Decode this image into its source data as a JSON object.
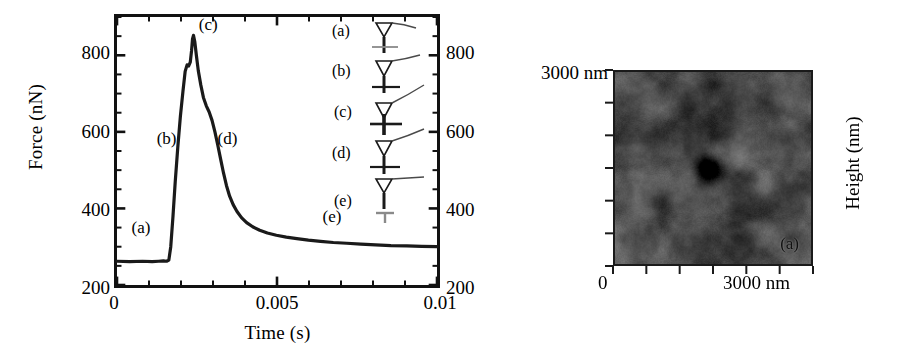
{
  "figure": {
    "panels": [
      "force-time-curve",
      "afm-topography"
    ]
  },
  "chart_data": [
    {
      "id": "force-vs-time",
      "type": "line",
      "title": "",
      "xlabel": "Time (s)",
      "ylabel": "Force (nN)",
      "xlim": [
        0,
        0.01
      ],
      "ylim": [
        200,
        900
      ],
      "xticks": [
        0,
        0.005,
        0.01
      ],
      "xticklabels": [
        "0",
        "0.005",
        "0.01"
      ],
      "yticks": [
        200,
        400,
        600,
        800
      ],
      "yticklabels": [
        "200",
        "400",
        "600",
        "800"
      ],
      "y_minor_tick_step": 50,
      "x_minor_tick_step": 0.001,
      "right_axis_mirrored": true,
      "right_yticklabels": [
        "200",
        "400",
        "600",
        "800"
      ],
      "grid": false,
      "legend": "none",
      "line_color": "#1a1a1a",
      "x": [
        0.0,
        0.0004,
        0.0008,
        0.0011,
        0.0013,
        0.00145,
        0.00155,
        0.00162,
        0.00168,
        0.00175,
        0.00182,
        0.0019,
        0.00198,
        0.00206,
        0.00213,
        0.00219,
        0.00224,
        0.00229,
        0.00233,
        0.00236,
        0.00239,
        0.00243,
        0.00248,
        0.00254,
        0.00262,
        0.0027,
        0.00279,
        0.00288,
        0.00297,
        0.00306,
        0.00315,
        0.00324,
        0.00333,
        0.00342,
        0.00352,
        0.00363,
        0.00375,
        0.00389,
        0.00405,
        0.00424,
        0.00446,
        0.0047,
        0.00498,
        0.00529,
        0.00562,
        0.00598,
        0.00636,
        0.00676,
        0.00718,
        0.00762,
        0.00808,
        0.00856,
        0.00906,
        0.00952,
        0.01
      ],
      "y": [
        262,
        261,
        262,
        261,
        262,
        263,
        262,
        265,
        300,
        380,
        470,
        560,
        640,
        705,
        758,
        775,
        772,
        782,
        812,
        843,
        852,
        836,
        800,
        760,
        722,
        690,
        668,
        652,
        630,
        600,
        565,
        528,
        492,
        460,
        432,
        410,
        392,
        376,
        363,
        352,
        343,
        336,
        330,
        325,
        321,
        317,
        314,
        311,
        309,
        307,
        305,
        303,
        302,
        301,
        300
      ],
      "annotations": [
        {
          "label": "(a)",
          "x": 0.00075,
          "y": 348
        },
        {
          "label": "(b)",
          "x": 0.00155,
          "y": 582
        },
        {
          "label": "(c)",
          "x": 0.00285,
          "y": 878
        },
        {
          "label": "(d)",
          "x": 0.00345,
          "y": 582
        },
        {
          "label": "(e)",
          "x": 0.00672,
          "y": 378
        }
      ],
      "inset": {
        "description": "AFM cantilever-tip schematic sequence",
        "rows": [
          {
            "label": "(a)"
          },
          {
            "label": "(b)"
          },
          {
            "label": "(c)"
          },
          {
            "label": "(d)"
          },
          {
            "label": "(e)"
          }
        ]
      }
    },
    {
      "id": "afm-topography",
      "type": "heatmap",
      "title": "",
      "xlabel": "",
      "ylabel": "Height (nm)",
      "x_axis_min_label": "0",
      "x_axis_max_label": "3000 nm",
      "y_axis_min_label": "0",
      "y_axis_max_label": "3000 nm",
      "xlim": [
        0,
        3000
      ],
      "ylim": [
        0,
        3000
      ],
      "x_tick_count": 7,
      "y_tick_count": 7,
      "colormap": "grayscale",
      "panel_label": "(a)",
      "feature": "dark indentation pit near image centre"
    }
  ],
  "left_panel": {
    "y_axis_title": "Force (nN)",
    "x_axis_title": "Time (s)",
    "y_tick_labels": [
      "800",
      "600",
      "400",
      "200"
    ],
    "y_tick_labels_right": [
      "800",
      "600",
      "400",
      "200"
    ],
    "x_tick_labels": [
      "0",
      "0.005",
      "0.01"
    ],
    "annotations": [
      "(a)",
      "(b)",
      "(c)",
      "(d)",
      "(e)"
    ],
    "inset_labels": [
      "(a)",
      "(b)",
      "(c)",
      "(d)",
      "(e)"
    ]
  },
  "right_panel": {
    "top_left_label": "3000 nm",
    "bottom_left_label": "0",
    "bottom_right_label": "3000 nm",
    "height_axis_title": "Height (nm)",
    "panel_label": "(a)"
  }
}
